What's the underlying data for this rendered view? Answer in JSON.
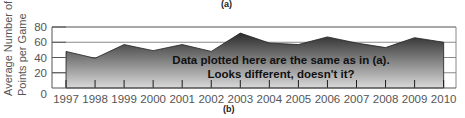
{
  "captions": {
    "top": "(a)",
    "bottom": "(b)"
  },
  "chart_data": {
    "type": "area",
    "title": "",
    "xlabel": "",
    "ylabel": "Average Number of Points per Game",
    "ylabel_lines": [
      "Average Number of",
      "Points per Game"
    ],
    "categories": [
      "1997",
      "1998",
      "1999",
      "2000",
      "2001",
      "2002",
      "2003",
      "2004",
      "2005",
      "2006",
      "2007",
      "2008",
      "2009",
      "2010"
    ],
    "values": [
      48,
      39,
      57,
      49,
      57,
      48,
      72,
      59,
      57,
      67,
      59,
      53,
      66,
      60
    ],
    "yticks": [
      0,
      20,
      40,
      60,
      80
    ],
    "ylim": [
      0,
      80
    ],
    "grid": "horizontal",
    "legend": null,
    "annotation": [
      "Data plotted here are the same as in (a).",
      "Looks different, doesn't it?"
    ],
    "fill": {
      "top": "#2b2b2b",
      "bottom": "#d9d9d9"
    },
    "subplot_label": "(b)"
  }
}
